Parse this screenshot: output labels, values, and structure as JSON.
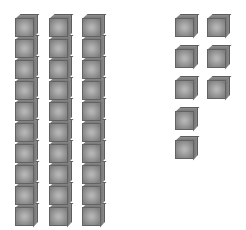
{
  "scene": {
    "title": "Base Ten Blocks",
    "description": "Three rods of ten unit cubes and eight loose unit cubes",
    "background_color": "#ffffff",
    "total_count": 38
  },
  "cube_style": {
    "size_px": 23,
    "front_face_light": "#b9b9b9",
    "front_face_dark": "#818181",
    "top_bevel_color": "#8f8f8f",
    "right_bevel_color": "#6f6f6f",
    "outline_color": "#636363"
  },
  "rods": {
    "label": "rods-of-ten",
    "count": 3,
    "cubes_per_rod": 10,
    "subtotal": 30,
    "items": [
      {
        "name": "rod-1",
        "x": 15,
        "y": 14,
        "cubes": 10
      },
      {
        "name": "rod-2",
        "x": 49,
        "y": 14,
        "cubes": 10
      },
      {
        "name": "rod-3",
        "x": 82,
        "y": 14,
        "cubes": 10
      }
    ]
  },
  "units": {
    "label": "loose-unit-cubes",
    "count": 8,
    "subtotal": 8,
    "items": [
      {
        "name": "unit-1",
        "x": 175,
        "y": 14
      },
      {
        "name": "unit-2",
        "x": 207,
        "y": 14
      },
      {
        "name": "unit-3",
        "x": 175,
        "y": 45
      },
      {
        "name": "unit-4",
        "x": 207,
        "y": 45
      },
      {
        "name": "unit-5",
        "x": 175,
        "y": 76
      },
      {
        "name": "unit-6",
        "x": 207,
        "y": 76
      },
      {
        "name": "unit-7",
        "x": 175,
        "y": 107
      },
      {
        "name": "unit-8",
        "x": 175,
        "y": 136
      }
    ]
  }
}
